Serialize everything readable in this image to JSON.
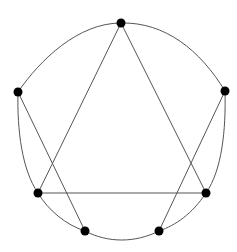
{
  "diagram": {
    "type": "graph",
    "background": "#ffffff",
    "stroke_color": "#555555",
    "vertex_color": "#000000",
    "vertex_radius": 4.5,
    "vertices": [
      {
        "id": "top",
        "x": 121,
        "y": 23
      },
      {
        "id": "right",
        "x": 225,
        "y": 91
      },
      {
        "id": "lower-right",
        "x": 206,
        "y": 193
      },
      {
        "id": "bottom-right",
        "x": 159,
        "y": 231
      },
      {
        "id": "bottom-left",
        "x": 85,
        "y": 231
      },
      {
        "id": "lower-left",
        "x": 38,
        "y": 193
      },
      {
        "id": "left",
        "x": 18,
        "y": 92
      }
    ],
    "outer_cycle": [
      "top",
      "right",
      "lower-right",
      "bottom-right",
      "bottom-left",
      "lower-left",
      "left",
      "top"
    ],
    "chords": [
      {
        "from": "top",
        "to": "lower-left"
      },
      {
        "from": "top",
        "to": "lower-right"
      },
      {
        "from": "lower-left",
        "to": "lower-right"
      },
      {
        "from": "left",
        "to": "bottom-left"
      },
      {
        "from": "right",
        "to": "bottom-right"
      }
    ]
  }
}
